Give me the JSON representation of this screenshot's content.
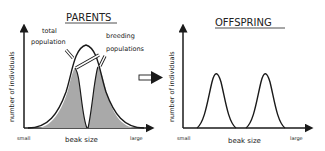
{
  "panels": {
    "parents": {
      "title": "PARENTS",
      "ylabel": "number of individuals",
      "xlabel": "beak size",
      "x_small": "small",
      "x_large": "large",
      "label_total": [
        "total",
        "population"
      ],
      "label_breeding": [
        "breeding",
        "populations"
      ]
    },
    "offspring": {
      "title": "OFFSPRING",
      "ylabel": "number of individuals",
      "xlabel": "beak size",
      "x_small": "small",
      "x_large": "large"
    }
  },
  "colors": {
    "line": "#1a1a1a",
    "shade": "#a9a9a9",
    "background": "#ffffff"
  }
}
